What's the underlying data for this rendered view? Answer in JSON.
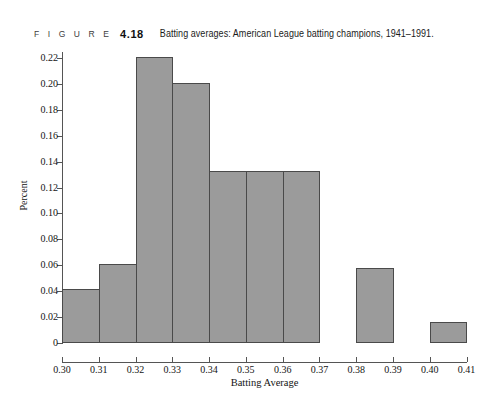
{
  "caption": {
    "figure_word": "F I G U R E",
    "number": "4.18",
    "title": "Batting averages: American League batting champions, 1941–1991."
  },
  "colors": {
    "bar_fill": "#9b9b9b",
    "bar_stroke": "#4a4a4a",
    "axis": "#555555",
    "text": "#141414"
  },
  "chart_data": {
    "type": "bar",
    "title": "Batting averages: American League batting champions, 1941–1991.",
    "xlabel": "Batting Average",
    "ylabel": "Percent",
    "bin_width": 0.01,
    "categories": [
      "0.30-0.31",
      "0.31-0.32",
      "0.32-0.33",
      "0.33-0.34",
      "0.34-0.35",
      "0.35-0.36",
      "0.36-0.37",
      "0.37-0.38",
      "0.38-0.39",
      "0.39-0.40",
      "0.40-0.41"
    ],
    "bin_starts": [
      0.3,
      0.31,
      0.32,
      0.33,
      0.34,
      0.35,
      0.36,
      0.37,
      0.38,
      0.39,
      0.4
    ],
    "values": [
      0.042,
      0.061,
      0.221,
      0.201,
      0.133,
      0.133,
      0.133,
      0.0,
      0.058,
      0.0,
      0.016
    ],
    "xlim": [
      0.3,
      0.41
    ],
    "ylim": [
      0,
      0.23
    ],
    "xticks": [
      0.3,
      0.31,
      0.32,
      0.33,
      0.34,
      0.35,
      0.36,
      0.37,
      0.38,
      0.39,
      0.4,
      0.41
    ],
    "xtick_labels": [
      "0.30",
      "0.31",
      "0.32",
      "0.33",
      "0.34",
      "0.35",
      "0.36",
      "0.37",
      "0.38",
      "0.39",
      "0.40",
      "0.41"
    ],
    "yticks": [
      0,
      0.02,
      0.04,
      0.06,
      0.08,
      0.1,
      0.12,
      0.14,
      0.16,
      0.18,
      0.2,
      0.22
    ],
    "ytick_labels": [
      "0",
      "0.02",
      "0.04",
      "0.06",
      "0.08",
      "0.10",
      "0.12",
      "0.14",
      "0.16",
      "0.18",
      "0.20",
      "0.22"
    ],
    "grid": false,
    "legend": false
  }
}
